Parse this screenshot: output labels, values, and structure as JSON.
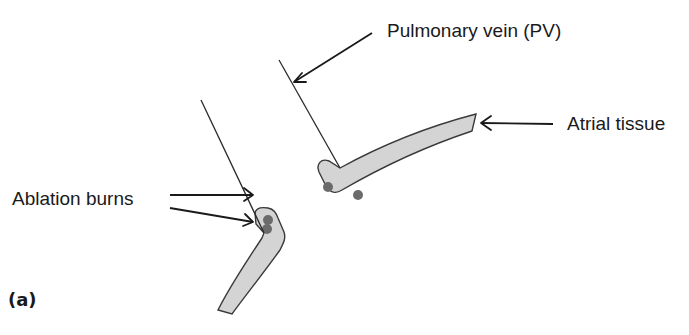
{
  "figure": {
    "panel_label": "(a)",
    "colors": {
      "tissue_fill": "#d4d4d4",
      "tissue_outline": "#3a3a3a",
      "burn_dot": "#6b6b6b",
      "line": "#1a1a1a"
    }
  },
  "labels": {
    "pulmonary_vein": "Pulmonary vein (PV)",
    "atrial_tissue": "Atrial tissue",
    "ablation_burns": "Ablation burns"
  }
}
